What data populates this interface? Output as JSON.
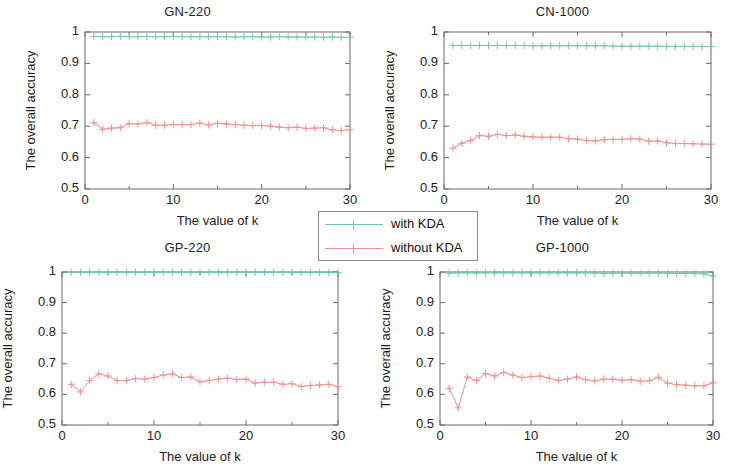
{
  "figure": {
    "width": 750,
    "height": 469,
    "background": "#ffffff"
  },
  "legend": {
    "entries": [
      {
        "label": "with KDA",
        "color": "#6fc7b1",
        "marker": "plus-marker"
      },
      {
        "label": "without KDA",
        "color": "#f08f8f",
        "marker": "plus-marker"
      }
    ]
  },
  "chart_data": [
    {
      "type": "line",
      "title": "GN-220",
      "xlabel": "The value of k",
      "ylabel": "The overall accuracy",
      "xlim": [
        0,
        30
      ],
      "ylim": [
        0.5,
        1
      ],
      "xticks": [
        0,
        10,
        20,
        30
      ],
      "xticklabels": [
        "0",
        "10",
        "20",
        "30"
      ],
      "yticks": [
        0.5,
        0.6,
        0.7,
        0.8,
        0.9,
        1
      ],
      "yticklabels": [
        "0.5",
        "0.6",
        "0.7",
        "0.8",
        "0.9",
        "1"
      ],
      "grid": false,
      "legend_position": "figure-center",
      "x": [
        1,
        2,
        3,
        4,
        5,
        6,
        7,
        8,
        9,
        10,
        11,
        12,
        13,
        14,
        15,
        16,
        17,
        18,
        19,
        20,
        21,
        22,
        23,
        24,
        25,
        26,
        27,
        28,
        29,
        30
      ],
      "series": [
        {
          "name": "with KDA",
          "color": "#6fc7b1",
          "marker": "plus-marker",
          "values": [
            0.986,
            0.985,
            0.985,
            0.986,
            0.985,
            0.985,
            0.986,
            0.985,
            0.985,
            0.986,
            0.985,
            0.985,
            0.985,
            0.985,
            0.985,
            0.985,
            0.984,
            0.985,
            0.985,
            0.984,
            0.984,
            0.985,
            0.984,
            0.984,
            0.984,
            0.984,
            0.983,
            0.984,
            0.983,
            0.983
          ]
        },
        {
          "name": "without KDA",
          "color": "#f08f8f",
          "marker": "plus-marker",
          "values": [
            0.711,
            0.69,
            0.694,
            0.695,
            0.708,
            0.707,
            0.712,
            0.703,
            0.703,
            0.705,
            0.705,
            0.705,
            0.71,
            0.704,
            0.709,
            0.707,
            0.705,
            0.703,
            0.702,
            0.702,
            0.7,
            0.697,
            0.695,
            0.697,
            0.693,
            0.694,
            0.695,
            0.688,
            0.686,
            0.689
          ]
        }
      ]
    },
    {
      "type": "line",
      "title": "CN-1000",
      "xlabel": "The value of k",
      "ylabel": "The overall accuracy",
      "xlim": [
        0,
        30
      ],
      "ylim": [
        0.5,
        1
      ],
      "xticks": [
        0,
        10,
        20,
        30
      ],
      "xticklabels": [
        "0",
        "10",
        "20",
        "30"
      ],
      "yticks": [
        0.5,
        0.6,
        0.7,
        0.8,
        0.9,
        1
      ],
      "yticklabels": [
        "0.5",
        "0.6",
        "0.7",
        "0.8",
        "0.9",
        "1"
      ],
      "grid": false,
      "x": [
        1,
        2,
        3,
        4,
        5,
        6,
        7,
        8,
        9,
        10,
        11,
        12,
        13,
        14,
        15,
        16,
        17,
        18,
        19,
        20,
        21,
        22,
        23,
        24,
        25,
        26,
        27,
        28,
        29,
        30
      ],
      "series": [
        {
          "name": "with KDA",
          "color": "#6fc7b1",
          "marker": "plus-marker",
          "values": [
            0.957,
            0.957,
            0.957,
            0.957,
            0.957,
            0.957,
            0.957,
            0.957,
            0.957,
            0.956,
            0.956,
            0.956,
            0.956,
            0.956,
            0.956,
            0.956,
            0.956,
            0.956,
            0.955,
            0.955,
            0.955,
            0.955,
            0.955,
            0.955,
            0.954,
            0.954,
            0.954,
            0.954,
            0.954,
            0.954
          ]
        },
        {
          "name": "without KDA",
          "color": "#f08f8f",
          "marker": "plus-marker",
          "values": [
            0.63,
            0.646,
            0.655,
            0.67,
            0.668,
            0.674,
            0.67,
            0.672,
            0.668,
            0.666,
            0.665,
            0.665,
            0.665,
            0.66,
            0.659,
            0.654,
            0.653,
            0.657,
            0.658,
            0.658,
            0.66,
            0.659,
            0.652,
            0.653,
            0.647,
            0.645,
            0.645,
            0.644,
            0.643,
            0.643
          ]
        }
      ]
    },
    {
      "type": "line",
      "title": "GP-220",
      "xlabel": "The value of k",
      "ylabel": "The overall accuracy",
      "xlim": [
        0,
        30
      ],
      "ylim": [
        0.5,
        1
      ],
      "xticks": [
        0,
        10,
        20,
        30
      ],
      "xticklabels": [
        "0",
        "10",
        "20",
        "30"
      ],
      "yticks": [
        0.5,
        0.6,
        0.7,
        0.8,
        0.9,
        1
      ],
      "yticklabels": [
        "0.5",
        "0.6",
        "0.7",
        "0.8",
        "0.9",
        "1"
      ],
      "grid": false,
      "x": [
        1,
        2,
        3,
        4,
        5,
        6,
        7,
        8,
        9,
        10,
        11,
        12,
        13,
        14,
        15,
        16,
        17,
        18,
        19,
        20,
        21,
        22,
        23,
        24,
        25,
        26,
        27,
        28,
        29,
        30
      ],
      "series": [
        {
          "name": "with KDA",
          "color": "#6fc7b1",
          "marker": "plus-marker",
          "values": [
            0.999,
            0.999,
            0.999,
            0.999,
            0.999,
            0.999,
            0.999,
            0.999,
            0.999,
            0.999,
            0.999,
            0.999,
            0.999,
            0.999,
            0.999,
            0.999,
            0.999,
            0.999,
            0.999,
            0.999,
            0.999,
            0.999,
            0.999,
            0.999,
            0.998,
            0.998,
            0.998,
            0.998,
            0.998,
            0.998
          ]
        },
        {
          "name": "without KDA",
          "color": "#f08f8f",
          "marker": "plus-marker",
          "values": [
            0.633,
            0.608,
            0.645,
            0.667,
            0.66,
            0.645,
            0.645,
            0.652,
            0.65,
            0.655,
            0.663,
            0.667,
            0.655,
            0.657,
            0.641,
            0.645,
            0.65,
            0.653,
            0.649,
            0.65,
            0.637,
            0.64,
            0.64,
            0.633,
            0.635,
            0.626,
            0.629,
            0.631,
            0.633,
            0.625
          ]
        }
      ]
    },
    {
      "type": "line",
      "title": "GP-1000",
      "xlabel": "The value of k",
      "ylabel": "The overall accuracy",
      "xlim": [
        0,
        30
      ],
      "ylim": [
        0.5,
        1
      ],
      "xticks": [
        0,
        10,
        20,
        30
      ],
      "xticklabels": [
        "0",
        "10",
        "20",
        "30"
      ],
      "yticks": [
        0.5,
        0.6,
        0.7,
        0.8,
        0.9,
        1
      ],
      "yticklabels": [
        "0.5",
        "0.6",
        "0.7",
        "0.8",
        "0.9",
        "1"
      ],
      "grid": false,
      "x": [
        1,
        2,
        3,
        4,
        5,
        6,
        7,
        8,
        9,
        10,
        11,
        12,
        13,
        14,
        15,
        16,
        17,
        18,
        19,
        20,
        21,
        22,
        23,
        24,
        25,
        26,
        27,
        28,
        29,
        30
      ],
      "series": [
        {
          "name": "with KDA",
          "color": "#6fc7b1",
          "marker": "plus-marker",
          "values": [
            0.996,
            0.997,
            0.997,
            0.997,
            0.997,
            0.997,
            0.997,
            0.997,
            0.997,
            0.997,
            0.997,
            0.997,
            0.997,
            0.997,
            0.997,
            0.997,
            0.996,
            0.996,
            0.996,
            0.996,
            0.996,
            0.996,
            0.996,
            0.996,
            0.996,
            0.995,
            0.995,
            0.995,
            0.994,
            0.987
          ]
        },
        {
          "name": "without KDA",
          "color": "#f08f8f",
          "marker": "plus-marker",
          "values": [
            0.62,
            0.556,
            0.657,
            0.645,
            0.668,
            0.66,
            0.672,
            0.663,
            0.655,
            0.658,
            0.66,
            0.653,
            0.645,
            0.65,
            0.657,
            0.648,
            0.644,
            0.65,
            0.65,
            0.646,
            0.648,
            0.643,
            0.645,
            0.656,
            0.637,
            0.632,
            0.63,
            0.628,
            0.628,
            0.638
          ]
        }
      ]
    }
  ]
}
